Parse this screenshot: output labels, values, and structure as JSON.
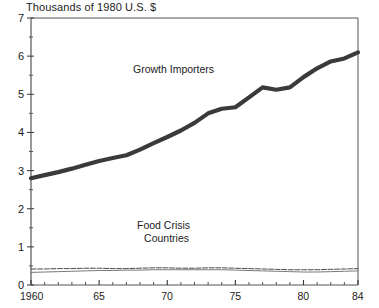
{
  "chart_data": {
    "type": "line",
    "title": "Thousands of 1980 U.S. $",
    "xlabel": "",
    "ylabel": "Thousands of 1980 U.S. $",
    "xlim": [
      1960,
      1984
    ],
    "ylim": [
      0,
      7
    ],
    "grid": false,
    "legend_position": "inline-annotations",
    "y_ticks_major": [
      0,
      1,
      2,
      3,
      4,
      5,
      6,
      7
    ],
    "y_ticks_minor": [
      0.5,
      1.5,
      2.5,
      3.5,
      4.5,
      5.5,
      6.5
    ],
    "y_tick_labels": [
      "0",
      "1",
      "2",
      "3",
      "4",
      "5",
      "6",
      "7"
    ],
    "x_ticks_major": [
      1960,
      1965,
      1970,
      1975,
      1980,
      1984
    ],
    "x_tick_labels": [
      "1960",
      "65",
      "70",
      "75",
      "80",
      "84"
    ],
    "x_ticks_minor": [
      1961,
      1962,
      1963,
      1964,
      1966,
      1967,
      1968,
      1969,
      1971,
      1972,
      1973,
      1974,
      1976,
      1977,
      1978,
      1979,
      1981,
      1982,
      1983
    ],
    "x": [
      1960,
      1961,
      1962,
      1963,
      1964,
      1965,
      1966,
      1967,
      1968,
      1969,
      1970,
      1971,
      1972,
      1973,
      1974,
      1975,
      1976,
      1977,
      1978,
      1979,
      1980,
      1981,
      1982,
      1983,
      1984
    ],
    "series": [
      {
        "name": "Growth Importers",
        "style": "thick-solid",
        "color": "#3a3a3a",
        "width_px": 4.2,
        "values": [
          2.8,
          2.88,
          2.96,
          3.05,
          3.15,
          3.25,
          3.33,
          3.4,
          3.55,
          3.72,
          3.88,
          4.05,
          4.25,
          4.5,
          4.62,
          4.66,
          4.92,
          5.18,
          5.12,
          5.18,
          5.45,
          5.68,
          5.86,
          5.94,
          6.1
        ]
      },
      {
        "name": "Food Crisis Countries",
        "style": "thin-dashed",
        "color": "#4a4a4a",
        "width_px": 1.0,
        "values": [
          0.42,
          0.42,
          0.43,
          0.43,
          0.44,
          0.44,
          0.43,
          0.43,
          0.44,
          0.45,
          0.45,
          0.44,
          0.44,
          0.45,
          0.45,
          0.44,
          0.43,
          0.42,
          0.41,
          0.4,
          0.4,
          0.4,
          0.41,
          0.42,
          0.43
        ]
      },
      {
        "name": "Food Crisis Countries (lower)",
        "style": "thin-solid",
        "color": "#7a7a7a",
        "width_px": 1.0,
        "values": [
          0.33,
          0.34,
          0.35,
          0.36,
          0.37,
          0.38,
          0.38,
          0.39,
          0.39,
          0.4,
          0.4,
          0.4,
          0.4,
          0.4,
          0.4,
          0.39,
          0.38,
          0.37,
          0.36,
          0.35,
          0.34,
          0.34,
          0.35,
          0.36,
          0.37
        ]
      }
    ],
    "annotations": [
      {
        "name": "growth-importers-label",
        "text": "Growth Importers"
      },
      {
        "name": "food-crisis-label-line1",
        "text": "Food Crisis"
      },
      {
        "name": "food-crisis-label-line2",
        "text": "Countries"
      }
    ]
  },
  "axis": {
    "title": "Thousands of 1980 U.S. $"
  }
}
